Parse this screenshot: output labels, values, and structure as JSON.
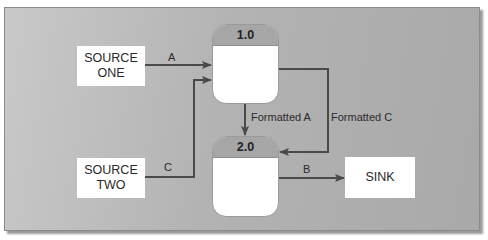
{
  "diagram": {
    "type": "data-flow-diagram",
    "entities": [
      {
        "id": "source_one",
        "lines": [
          "SOURCE",
          "ONE"
        ]
      },
      {
        "id": "source_two",
        "lines": [
          "SOURCE",
          "TWO"
        ]
      },
      {
        "id": "sink",
        "lines": [
          "SINK"
        ]
      }
    ],
    "processes": [
      {
        "id": "p1",
        "number": "1.0"
      },
      {
        "id": "p2",
        "number": "2.0"
      }
    ],
    "flows": [
      {
        "from": "source_one",
        "to": "p1",
        "label": "A"
      },
      {
        "from": "source_two",
        "to": "p1",
        "label": "C"
      },
      {
        "from": "p1",
        "to": "p2",
        "label": "Formatted A"
      },
      {
        "from": "p1",
        "to": "p2",
        "label": "Formatted C"
      },
      {
        "from": "p2",
        "to": "sink",
        "label": "B"
      }
    ]
  },
  "colors": {
    "background": "#b3b3b3",
    "process_header": "#a6a6a6",
    "box_fill": "#ffffff",
    "line": "#4a4a4a"
  }
}
